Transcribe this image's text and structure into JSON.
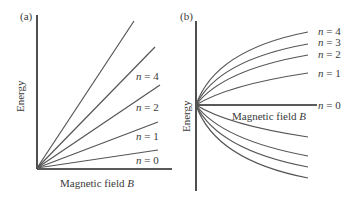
{
  "panels": [
    {
      "id": "a",
      "label": "(a)",
      "y_axis_label": "Energy",
      "x_axis_label": "Magnetic field",
      "x_axis_symbol": "B",
      "line_labels": [
        {
          "n": "n",
          "eq": " = 4"
        },
        {
          "n": "n",
          "eq": " = 2"
        },
        {
          "n": "n",
          "eq": " = 1"
        },
        {
          "n": "n",
          "eq": " = 0"
        }
      ]
    },
    {
      "id": "b",
      "label": "(b)",
      "y_axis_label": "Energy",
      "x_axis_label": "Magnetic field",
      "x_axis_symbol": "B",
      "line_labels": [
        {
          "n": "n",
          "eq": " = 4"
        },
        {
          "n": "n",
          "eq": " = 3"
        },
        {
          "n": "n",
          "eq": " = 2"
        },
        {
          "n": "n",
          "eq": " = 1"
        },
        {
          "n": "n",
          "eq": " = 0"
        }
      ]
    }
  ],
  "colors": {
    "line": "#555555",
    "axis": "#222222",
    "text": "#3a3a3a"
  }
}
